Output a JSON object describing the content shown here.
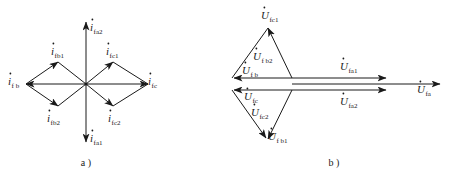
{
  "figure": {
    "panel_a": {
      "caption": "a )",
      "title_note": "current phasor diagram",
      "vectors": [
        {
          "name": "i-fb1",
          "sym": "i",
          "sub": "fb1",
          "label": "i̇fb1"
        },
        {
          "name": "i-fc1",
          "sym": "i",
          "sub": "fc1",
          "label": "i̇fc1"
        },
        {
          "name": "i-fb",
          "sym": "i",
          "sub": "f b",
          "label": "i̇fb"
        },
        {
          "name": "i-fc",
          "sym": "i",
          "sub": "fc",
          "label": "i̇fc"
        },
        {
          "name": "i-fa2",
          "sym": "i",
          "sub": "fa2",
          "label": "i̇fa2"
        },
        {
          "name": "i-fa1",
          "sym": "i",
          "sub": "fa1",
          "label": "i̇fa1"
        },
        {
          "name": "i-fb2",
          "sym": "i",
          "sub": "fb2",
          "label": "i̇fb2"
        },
        {
          "name": "i-fc2",
          "sym": "i",
          "sub": "fc2",
          "label": "i̇fc2"
        }
      ],
      "sym_i": "i",
      "sub_fb1": "fb1",
      "sub_fc1": "fc1",
      "sub_fb": "f b",
      "sub_fc": "fc",
      "sub_fa2": "fa2",
      "sub_fa1": "fa1",
      "sub_fb2": "fb2",
      "sub_fc2": "fc2"
    },
    "panel_b": {
      "caption": "b )",
      "title_note": "voltage phasor diagram",
      "sym_u": "U",
      "sub_fc1": "fc1",
      "sub_fb2": "f b2",
      "sub_fb": "f b",
      "sub_fc": "fc",
      "sub_fc2": "fc2",
      "sub_fb1": "f b1",
      "sub_fa1": "fa1",
      "sub_fa2": "fa2",
      "sub_fa": "fa",
      "vectors": [
        {
          "name": "u-fc1",
          "sym": "U",
          "sub": "fc1",
          "label": "U̇fc1"
        },
        {
          "name": "u-fb2",
          "sym": "U",
          "sub": "f b2",
          "label": "U̇fb2"
        },
        {
          "name": "u-fb",
          "sym": "U",
          "sub": "f b",
          "label": "U̇fb"
        },
        {
          "name": "u-fc",
          "sym": "U",
          "sub": "fc",
          "label": "U̇fc"
        },
        {
          "name": "u-fc2",
          "sym": "U",
          "sub": "fc2",
          "label": "U̇fc2"
        },
        {
          "name": "u-fb1",
          "sym": "U",
          "sub": "f b1",
          "label": "U̇fb1"
        },
        {
          "name": "u-fa1",
          "sym": "U",
          "sub": "fa1",
          "label": "U̇fa1"
        },
        {
          "name": "u-fa2",
          "sym": "U",
          "sub": "fa2",
          "label": "U̇fa2"
        },
        {
          "name": "u-fa",
          "sym": "U",
          "sub": "fa",
          "label": "U̇fa"
        }
      ]
    },
    "colors": {
      "ink": "#1a1a1a",
      "background": "#ffffff"
    }
  }
}
